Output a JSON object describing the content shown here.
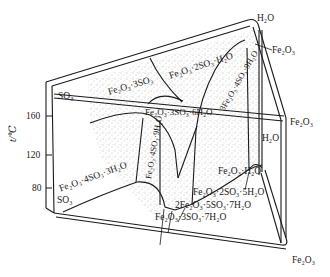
{
  "diagram": {
    "type": "ternary-prism phase diagram",
    "axis": {
      "label": "t/℃",
      "ticks": [
        "160",
        "120",
        "80"
      ]
    },
    "corner_labels": {
      "top_water": "H₂O",
      "top_iron_oxide": "Fe₂O₃",
      "top_sulfur_trioxide": "SO₃",
      "mid_iron_oxide": "Fe₂O₃",
      "mid_water": "H₂O",
      "bottom_sulfur_trioxide": "SO₃",
      "bottom_iron_oxide": "Fe₂O₃"
    },
    "phase_labels": [
      "Fe₂O₃·3SO₃",
      "Fe₂O₃·2SO₃·H₂O",
      "3Fe₂O₃·4SO₃·9H₂O",
      "Fe₂O₃·3SO₃·6H₂O",
      "Fe₂O₃·4SO₃·9H₂O",
      "Fe₂O₃·4SO₃·3H₂O",
      "Fe₂O₃·H₂O",
      "Fe₂O₃·2SO₃·5H₂O",
      "2Fe₂O₃·5SO₃·7H₂O",
      "Fe₂O₃·3SO₃·7H₂O"
    ],
    "colors": {
      "line": "#1a1a1a",
      "stipple": "#6e6e6e",
      "background": "#ffffff"
    }
  }
}
